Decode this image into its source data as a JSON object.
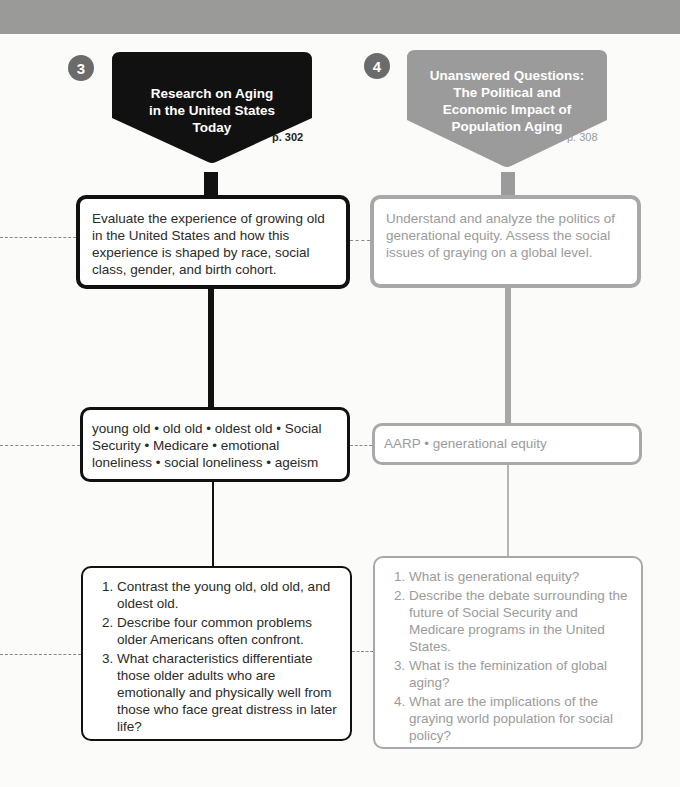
{
  "colors": {
    "header_band": "#9a9a98",
    "dark": "#111111",
    "light_border": "#a8a8a8",
    "light_text": "#9b9b9b",
    "badge": "#6b6b6b",
    "banner_gray": "#9b9b9b"
  },
  "columns": [
    {
      "number": "3",
      "title_lines": [
        "Research on Aging",
        "in the United States",
        "Today"
      ],
      "page": "p. 302",
      "objective": "Evaluate the experience of growing old in the United States and how this experience is shaped by race, social class, gender, and birth cohort.",
      "key_terms": "young old • old old • oldest old • Social Security • Medicare • emotional loneliness • social loneliness • ageism",
      "questions": [
        "Contrast the young old, old old, and oldest old.",
        "Describe four common problems older Americans often confront.",
        "What characteristics differentiate those older adults who are emotionally and physically well from those who face great distress in later life?"
      ]
    },
    {
      "number": "4",
      "title_lines": [
        "Unanswered Questions:",
        "The Political and",
        "Economic Impact of",
        "Population Aging"
      ],
      "page": "p. 308",
      "objective": "Understand and analyze the politics of generational equity. Assess the social issues of graying on a global level.",
      "key_terms": "AARP • generational equity",
      "questions": [
        "What is generational equity?",
        "Describe the debate surrounding the future of Social Security and Medicare programs in the United States.",
        "What is the feminization of global aging?",
        "What are the implications of the graying world population for social policy?"
      ]
    }
  ]
}
